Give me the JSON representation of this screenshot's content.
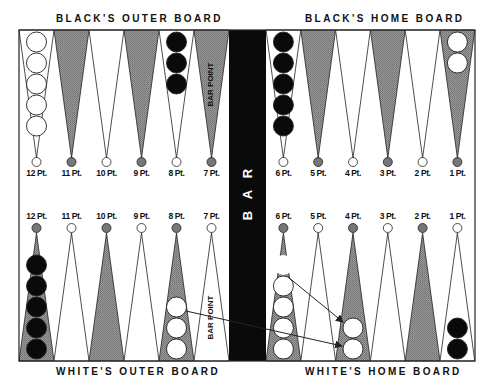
{
  "titles": {
    "top_left": "BLACK'S OUTER BOARD",
    "top_right": "BLACK'S HOME BOARD",
    "bottom_left": "WHITE'S OUTER BOARD",
    "bottom_right": "WHITE'S HOME BOARD"
  },
  "bar": {
    "letters": [
      "B",
      "A",
      "R"
    ]
  },
  "bar_point_label": "BAR POINT",
  "colors": {
    "board_bg": "#ffffff",
    "shaded_point": "#8a8a8a",
    "bar": "#0a0a0a",
    "black_checker": "#0a0a0a",
    "white_checker": "#ffffff",
    "outline": "#222222"
  },
  "top_points": [
    {
      "label": "12 Pt.",
      "shaded": false,
      "checkers": {
        "color": "white",
        "count": 5
      }
    },
    {
      "label": "11 Pt.",
      "shaded": true,
      "checkers": {
        "color": "none",
        "count": 0
      }
    },
    {
      "label": "10 Pt.",
      "shaded": false,
      "checkers": {
        "color": "none",
        "count": 0
      }
    },
    {
      "label": "9 Pt.",
      "shaded": true,
      "checkers": {
        "color": "none",
        "count": 0
      }
    },
    {
      "label": "8 Pt.",
      "shaded": false,
      "checkers": {
        "color": "black",
        "count": 3
      }
    },
    {
      "label": "7 Pt.",
      "shaded": true,
      "checkers": {
        "color": "none",
        "count": 0
      },
      "note": "BAR POINT"
    },
    {
      "label": "6 Pt.",
      "shaded": false,
      "checkers": {
        "color": "black",
        "count": 5
      }
    },
    {
      "label": "5 Pt.",
      "shaded": true,
      "checkers": {
        "color": "none",
        "count": 0
      }
    },
    {
      "label": "4 Pt.",
      "shaded": false,
      "checkers": {
        "color": "none",
        "count": 0
      }
    },
    {
      "label": "3 Pt.",
      "shaded": true,
      "checkers": {
        "color": "none",
        "count": 0
      }
    },
    {
      "label": "2 Pt.",
      "shaded": false,
      "checkers": {
        "color": "none",
        "count": 0
      }
    },
    {
      "label": "1 Pt.",
      "shaded": true,
      "checkers": {
        "color": "white",
        "count": 2
      }
    }
  ],
  "bottom_points": [
    {
      "label": "12 Pt.",
      "shaded": true,
      "checkers": {
        "color": "black",
        "count": 5
      }
    },
    {
      "label": "11 Pt.",
      "shaded": false,
      "checkers": {
        "color": "none",
        "count": 0
      }
    },
    {
      "label": "10 Pt.",
      "shaded": true,
      "checkers": {
        "color": "none",
        "count": 0
      }
    },
    {
      "label": "9 Pt.",
      "shaded": false,
      "checkers": {
        "color": "none",
        "count": 0
      }
    },
    {
      "label": "8 Pt.",
      "shaded": true,
      "checkers": {
        "color": "white",
        "count": 3
      }
    },
    {
      "label": "7 Pt.",
      "shaded": false,
      "checkers": {
        "color": "none",
        "count": 0
      },
      "note": "BAR POINT"
    },
    {
      "label": "6 Pt.",
      "shaded": true,
      "checkers": {
        "color": "white",
        "count": 4,
        "ghost": 1
      }
    },
    {
      "label": "5 Pt.",
      "shaded": false,
      "checkers": {
        "color": "none",
        "count": 0
      }
    },
    {
      "label": "4 Pt.",
      "shaded": true,
      "checkers": {
        "color": "white",
        "count": 2
      }
    },
    {
      "label": "3 Pt.",
      "shaded": false,
      "checkers": {
        "color": "none",
        "count": 0
      }
    },
    {
      "label": "2 Pt.",
      "shaded": true,
      "checkers": {
        "color": "none",
        "count": 0
      }
    },
    {
      "label": "1 Pt.",
      "shaded": false,
      "checkers": {
        "color": "black",
        "count": 2
      }
    }
  ],
  "moves": [
    {
      "from": "white 6 Pt. (top checker)",
      "to": "white 4 Pt."
    },
    {
      "from": "white 8 Pt. (top checker)",
      "to": "white 4 Pt."
    }
  ]
}
